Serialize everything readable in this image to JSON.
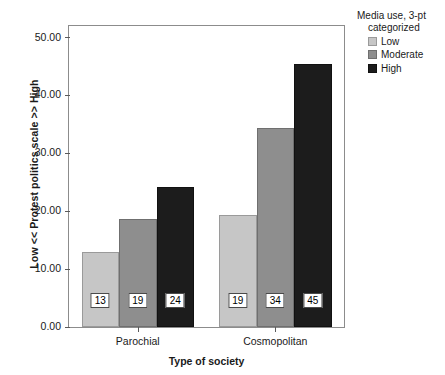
{
  "chart_data": {
    "type": "bar",
    "title": "",
    "xlabel": "Type of society",
    "ylabel": "Low << Protest politics scale >> High",
    "categories": [
      "Parochial",
      "Cosmopolitan"
    ],
    "ylim": [
      0.0,
      52.0
    ],
    "grid": false,
    "legend_position": "right",
    "legend_title": "Media use, 3-pt categorized",
    "legend_title_line1": "Media use, 3-pt",
    "legend_title_line2": "categorized",
    "ytick_labels": [
      "0.00",
      "10.00",
      "20.00",
      "30.00",
      "40.00",
      "50.00"
    ],
    "ytick_values": [
      0,
      10,
      20,
      30,
      40,
      50
    ],
    "series": [
      {
        "name": "Low",
        "color": "#c6c6c6",
        "values": [
          13.0,
          19.4
        ],
        "data_labels": [
          "13",
          "19"
        ]
      },
      {
        "name": "Moderate",
        "color": "#8e8e8e",
        "values": [
          18.7,
          34.3
        ],
        "data_labels": [
          "19",
          "34"
        ]
      },
      {
        "name": "High",
        "color": "#1c1c1c",
        "values": [
          24.2,
          45.5
        ],
        "data_labels": [
          "24",
          "45"
        ]
      }
    ]
  }
}
